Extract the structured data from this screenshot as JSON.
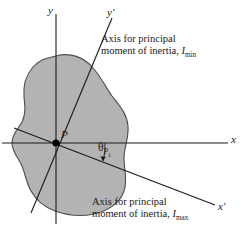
{
  "figure": {
    "type": "engineering-diagram",
    "colors": {
      "blob_fill": "#b3b3b3",
      "blob_stroke": "#4d4d4d",
      "axis_stroke": "#1a1a1a",
      "background": "#ffffff",
      "text": "#1a1a1a"
    }
  },
  "axes": {
    "x_label": "x",
    "y_label": "y",
    "x_prime_label": "x′",
    "y_prime_label": "y′"
  },
  "point": {
    "label": "P"
  },
  "angle": {
    "symbol": "θ",
    "sub_main": "P",
    "sub_index": "1"
  },
  "annotations": {
    "min_axis": {
      "line1": "Axis for principal",
      "line2_prefix": "moment of inertia, ",
      "line2_symbol": "I",
      "line2_subscript": "min"
    },
    "max_axis": {
      "line1": "Axis for principal",
      "line2_prefix": "moment of inertia, ",
      "line2_symbol": "I",
      "line2_subscript": "max"
    }
  }
}
